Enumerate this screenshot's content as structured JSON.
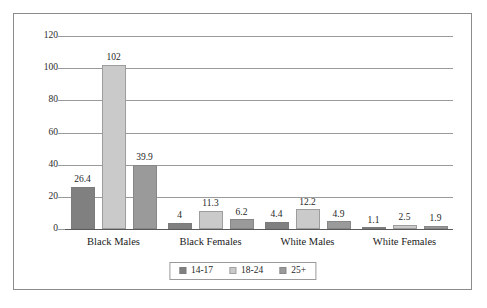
{
  "chart_data": {
    "type": "bar",
    "title": "",
    "subtitle": "",
    "xlabel": "",
    "ylabel": "",
    "categories": [
      "Black Males",
      "Black Females",
      "White Males",
      "White Females"
    ],
    "series": [
      {
        "name": "14-17",
        "color": "#808080",
        "values": [
          26.4,
          4,
          4.4,
          1.1
        ],
        "labels": [
          "26.4",
          "4",
          "4.4",
          "1.1"
        ]
      },
      {
        "name": "18-24",
        "color": "#cacaca",
        "values": [
          102,
          11.3,
          12.2,
          2.5
        ],
        "labels": [
          "102",
          "11.3",
          "12.2",
          "2.5"
        ]
      },
      {
        "name": "25+",
        "color": "#9a9a9a",
        "values": [
          39.9,
          6.2,
          4.9,
          1.9
        ],
        "labels": [
          "39.9",
          "6.2",
          "4.9",
          "1.9"
        ]
      }
    ],
    "ylim": [
      0,
      120
    ],
    "yticks": [
      0,
      20,
      40,
      60,
      80,
      100,
      120
    ],
    "ytick_labels": [
      "0",
      "20",
      "40",
      "60",
      "80",
      "100",
      "120"
    ],
    "grid": true,
    "grid_axis": "y",
    "legend_position": "bottom",
    "data_labels": true,
    "frame": true,
    "colors": {
      "grid": "#9a9a9a",
      "axis": "#5a5a5a",
      "border": "#8c8c8c",
      "text": "#1a1a1a",
      "background": "#ffffff"
    }
  }
}
